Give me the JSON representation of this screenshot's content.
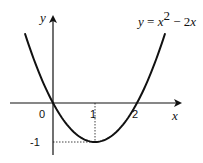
{
  "diagram": {
    "equation": {
      "y": "y",
      "eq": " = ",
      "x": "x",
      "exp": "2",
      "rest_op": " − 2",
      "rest_x": "x"
    },
    "axes": {
      "x_label": "x",
      "y_label": "y"
    },
    "ticks": {
      "origin": "0",
      "x1": "1",
      "x2": "2",
      "ym1": "-1"
    },
    "curve": {
      "function": "y = x^2 - 2x",
      "vertex": [
        1,
        -1
      ],
      "roots": [
        0,
        2
      ],
      "x_range": [
        -0.67,
        2.67
      ]
    },
    "colors": {
      "stroke": "#111111",
      "background": "#ffffff"
    }
  }
}
